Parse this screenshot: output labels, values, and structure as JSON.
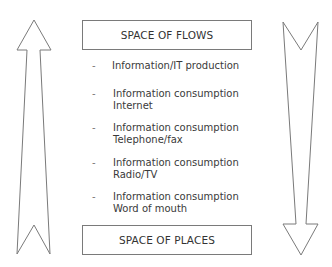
{
  "diagram": {
    "top_box": {
      "label": "SPACE OF FLOWS"
    },
    "bottom_box": {
      "label": "SPACE OF PLACES"
    },
    "items": [
      {
        "bullet": "-",
        "line1": "Information/IT production",
        "line2": ""
      },
      {
        "bullet": "-",
        "line1": "Information consumption",
        "line2": "Internet"
      },
      {
        "bullet": "-",
        "line1": "Information consumption",
        "line2": "Telephone/fax"
      },
      {
        "bullet": "-",
        "line1": "Information consumption",
        "line2": "Radio/TV"
      },
      {
        "bullet": "-",
        "line1": "Information consumption",
        "line2": "Word of mouth"
      }
    ],
    "left_arrow": {
      "direction": "up"
    },
    "right_arrow": {
      "direction": "down"
    },
    "colors": {
      "stroke": "#7a7a7a",
      "text": "#333333",
      "background": "#ffffff"
    }
  }
}
